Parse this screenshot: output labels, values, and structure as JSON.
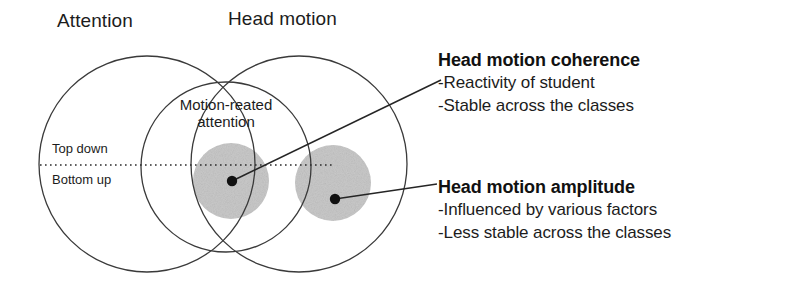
{
  "diagram": {
    "type": "venn-diagram",
    "title_left": "Attention",
    "title_right": "Head motion",
    "overlap_label": "Motion-reated attention",
    "divider_labels": {
      "upper": "Top down",
      "lower": "Bottom up"
    },
    "regions": [
      {
        "name": "attention-ellipse",
        "label": "Attention"
      },
      {
        "name": "head-motion-ellipse",
        "label": "Head motion"
      },
      {
        "name": "motion-related-attention-ellipse",
        "label": "Motion-reated attention"
      }
    ],
    "markers": [
      {
        "name": "head-motion-coherence-point",
        "label": "Head motion coherence"
      },
      {
        "name": "head-motion-amplitude-point",
        "label": "Head motion amplitude"
      }
    ],
    "colors": {
      "outline": "#3a3a3a",
      "cluster_fill": "#c9c9c9",
      "marker": "#111111",
      "text": "#1c1c1c",
      "background": "#ffffff"
    }
  },
  "annotations": [
    {
      "heading": "Head motion coherence",
      "lines": [
        "-Reactivity of student",
        "-Stable across the classes"
      ]
    },
    {
      "heading": "Head motion amplitude",
      "lines": [
        "-Influenced by various factors",
        "-Less stable across the classes"
      ]
    }
  ]
}
